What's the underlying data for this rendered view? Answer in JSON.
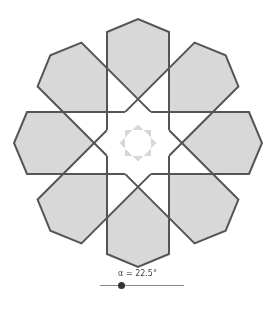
{
  "figure": {
    "center": [
      138,
      143
    ],
    "petal_count": 8,
    "tip_distance": 124,
    "shoulder_distance": 111,
    "inner_distance": 13,
    "half_width": 31,
    "start_angle_deg": -90,
    "colors": {
      "fill": "#d8d8d8",
      "stroke": "#555555",
      "background": "#ffffff"
    },
    "stroke_width": 2
  },
  "slider": {
    "label": "α = 22.5°",
    "variable": "α",
    "value_deg": 22.5,
    "track_color": "#888888",
    "knob_color": "#333333"
  }
}
